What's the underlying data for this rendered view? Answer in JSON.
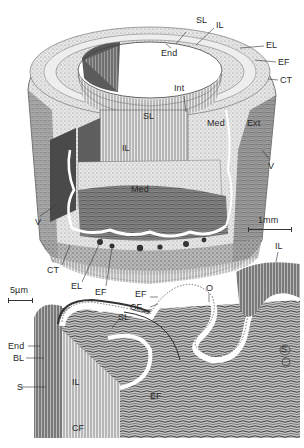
{
  "figure": {
    "colors": {
      "ink": "#2a2a2a",
      "paper": "#ffffff",
      "shade_dark": "#5a5a5a",
      "shade_mid": "#9a9a9a",
      "shade_light": "#d8d8d8"
    }
  },
  "upper_drawing": {
    "labels": {
      "sl_top": "SL",
      "il_top": "IL",
      "end": "End",
      "el": "EL",
      "ef": "EF",
      "ct": "CT",
      "int": "Int",
      "sl_mid": "SL",
      "med": "Med",
      "ext": "Ext",
      "il_cut": "IL",
      "med_cut": "Med",
      "v_right": "V",
      "v_left": "V",
      "ct_bottom": "CT",
      "el_bottom": "EL",
      "ef_bottom": "EF"
    },
    "scale_bar": {
      "label": "1mm"
    }
  },
  "lower_drawing": {
    "labels": {
      "ef_top": "EF",
      "cf_top": "CF",
      "o": "O",
      "sl": "SL",
      "end": "End",
      "bl": "BL",
      "il": "IL",
      "ef_mid": "EF",
      "s_left": "S",
      "cf_bottom": "CF",
      "il_right": "IL",
      "s_right": "S"
    },
    "scale_bar": {
      "label": "5µm"
    }
  }
}
